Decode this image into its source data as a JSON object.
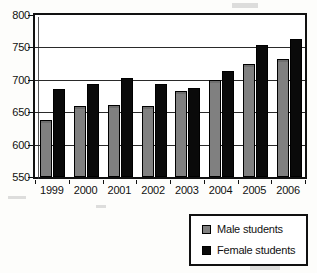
{
  "chart_data": {
    "type": "bar",
    "title": "",
    "xlabel": "",
    "ylabel": "",
    "categories": [
      "1999",
      "2000",
      "2001",
      "2002",
      "2003",
      "2004",
      "2005",
      "2006"
    ],
    "series": [
      {
        "name": "Male students",
        "color": "#808080",
        "values": [
          635,
          657,
          658,
          657,
          680,
          697,
          722,
          729
        ]
      },
      {
        "name": "Female students",
        "color": "#0a0a0a",
        "values": [
          682,
          690,
          700,
          690,
          685,
          710,
          750,
          760
        ]
      }
    ],
    "ylim": [
      550,
      800
    ],
    "yticks": [
      550,
      600,
      650,
      700,
      750,
      800
    ],
    "ytick_labels": [
      "550",
      "600",
      "650",
      "700",
      "750",
      "800"
    ],
    "grid": true,
    "legend_position": "bottom-right"
  },
  "legend": {
    "items": [
      {
        "label": "Male students",
        "swatch": "male-swatch"
      },
      {
        "label": "Female students",
        "swatch": "female-swatch"
      }
    ]
  }
}
